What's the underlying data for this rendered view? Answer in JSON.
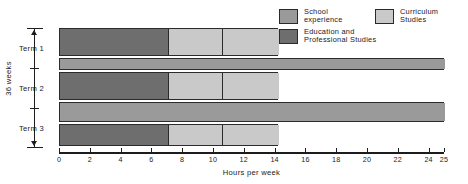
{
  "chart_data": {
    "type": "bar",
    "orientation": "horizontal",
    "stacked": true,
    "title": "",
    "xlabel": "Hours per week",
    "ylabel": "36 weeks",
    "xlim": [
      0,
      25
    ],
    "grid": false,
    "legend_position": "top-right",
    "categories": [
      "Term 1",
      "Term 2",
      "Term 3"
    ],
    "xticks": [
      0,
      2,
      4,
      6,
      8,
      10,
      12,
      14,
      16,
      18,
      20,
      22,
      24,
      25
    ],
    "xtick_labels": [
      "0",
      "2",
      "4",
      "6",
      "8",
      "10",
      "12",
      "14",
      "16",
      "18",
      "20",
      "22",
      "24",
      "25"
    ],
    "series": [
      {
        "name": "Education and Professional Studies",
        "color": "#6e6e6e",
        "values": [
          7.1,
          7.1,
          7.1
        ]
      },
      {
        "name": "Curriculum Studies",
        "color": "#c9c9c9",
        "values": [
          7.1,
          7.1,
          7.1
        ],
        "segment_breaks": [
          10.6,
          10.6,
          10.6
        ],
        "ends": [
          14.2,
          14.2,
          14.2
        ]
      },
      {
        "name": "School experience",
        "color": "#9a9a9a",
        "values": [
          25,
          25,
          25
        ]
      }
    ],
    "bars": [
      {
        "term": "Term 1",
        "rows": [
          {
            "kind": "stacked",
            "segments": [
              {
                "series": "Education and Professional Studies",
                "start": 0,
                "end": 7.1,
                "color": "#6e6e6e"
              },
              {
                "series": "Curriculum Studies",
                "start": 7.1,
                "end": 10.6,
                "color": "#c9c9c9"
              },
              {
                "series": "Curriculum Studies",
                "start": 10.6,
                "end": 14.2,
                "color": "#c9c9c9"
              }
            ]
          },
          {
            "kind": "single",
            "segments": [
              {
                "series": "School experience",
                "start": 0,
                "end": 25,
                "color": "#9a9a9a"
              }
            ]
          }
        ]
      },
      {
        "term": "Term 2",
        "rows": [
          {
            "kind": "stacked",
            "segments": [
              {
                "series": "Education and Professional Studies",
                "start": 0,
                "end": 7.1,
                "color": "#6e6e6e"
              },
              {
                "series": "Curriculum Studies",
                "start": 7.1,
                "end": 10.6,
                "color": "#c9c9c9"
              },
              {
                "series": "Curriculum Studies",
                "start": 10.6,
                "end": 14.2,
                "color": "#c9c9c9"
              }
            ]
          }
        ]
      },
      {
        "term": "Term 3",
        "rows": [
          {
            "kind": "single",
            "segments": [
              {
                "series": "School experience",
                "start": 0,
                "end": 25,
                "color": "#9a9a9a"
              }
            ]
          },
          {
            "kind": "stacked",
            "segments": [
              {
                "series": "Education and Professional Studies",
                "start": 0,
                "end": 7.1,
                "color": "#6e6e6e"
              },
              {
                "series": "Curriculum Studies",
                "start": 7.1,
                "end": 10.6,
                "color": "#c9c9c9"
              },
              {
                "series": "Curriculum Studies",
                "start": 10.6,
                "end": 14.2,
                "color": "#c9c9c9"
              }
            ]
          }
        ]
      }
    ]
  },
  "legend": {
    "school_experience": "School\nexperience",
    "curriculum_studies": "Curriculum\nStudies",
    "education_professional": "Education and\nProfessional Studies"
  },
  "axis": {
    "title": "Hours per week",
    "ticks": [
      "0",
      "2",
      "4",
      "6",
      "8",
      "10",
      "12",
      "14",
      "16",
      "18",
      "20",
      "22",
      "24",
      "25"
    ]
  },
  "terms": {
    "term1": "Term 1",
    "term2": "Term 2",
    "term3": "Term 3",
    "bracket_label": "36 weeks"
  },
  "colors": {
    "education_professional": "#6e6e6e",
    "school_experience": "#9a9a9a",
    "curriculum_studies": "#c9c9c9",
    "outline": "#2b2b2b",
    "text": "#1a1a1a"
  }
}
